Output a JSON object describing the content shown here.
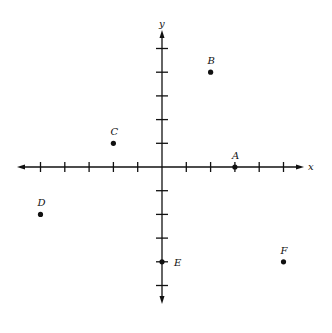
{
  "chart_data": {
    "type": "scatter",
    "title": "",
    "xlabel": "x",
    "ylabel": "y",
    "xlim": [
      -6,
      6
    ],
    "ylim": [
      -6,
      6
    ],
    "x_ticks": [
      -5,
      -4,
      -3,
      -2,
      -1,
      1,
      2,
      3,
      4,
      5
    ],
    "y_ticks": [
      -5,
      -4,
      -3,
      -2,
      -1,
      1,
      2,
      3,
      4,
      5
    ],
    "grid": false,
    "points": [
      {
        "label": "A",
        "x": 3,
        "y": 0
      },
      {
        "label": "B",
        "x": 2,
        "y": 4
      },
      {
        "label": "C",
        "x": -2,
        "y": 1
      },
      {
        "label": "D",
        "x": -5,
        "y": -2
      },
      {
        "label": "E",
        "x": 0,
        "y": -4
      },
      {
        "label": "F",
        "x": 5,
        "y": -4
      }
    ]
  }
}
